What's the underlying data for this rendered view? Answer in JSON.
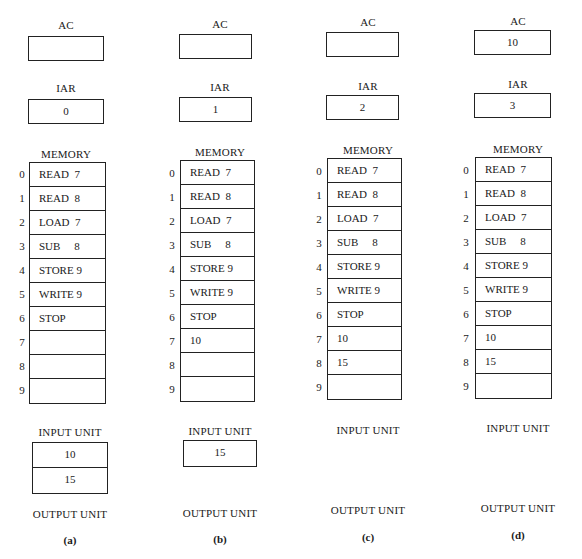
{
  "labels": {
    "ac": "AC",
    "iar": "IAR",
    "memory": "MEMORY",
    "input_unit": "INPUT UNIT",
    "output_unit": "OUTPUT UNIT"
  },
  "addresses": [
    "0",
    "1",
    "2",
    "3",
    "4",
    "5",
    "6",
    "7",
    "8",
    "9"
  ],
  "panels": [
    {
      "caption": "(a)",
      "ac": "",
      "iar": "0",
      "memory": [
        "READ  7",
        "READ  8",
        "LOAD  7",
        "SUB     8",
        "STORE 9",
        "WRITE 9",
        "STOP",
        "",
        "",
        ""
      ],
      "input_unit": [
        "10",
        "15"
      ]
    },
    {
      "caption": "(b)",
      "ac": "",
      "iar": "1",
      "memory": [
        "READ  7",
        "READ  8",
        "LOAD  7",
        "SUB     8",
        "STORE 9",
        "WRITE 9",
        "STOP",
        "10",
        "",
        ""
      ],
      "input_unit": [
        "15"
      ]
    },
    {
      "caption": "(c)",
      "ac": "",
      "iar": "2",
      "memory": [
        "READ  7",
        "READ  8",
        "LOAD  7",
        "SUB     8",
        "STORE 9",
        "WRITE 9",
        "STOP",
        "10",
        "15",
        ""
      ],
      "input_unit": []
    },
    {
      "caption": "(d)",
      "ac": "10",
      "iar": "3",
      "memory": [
        "READ  7",
        "READ  8",
        "LOAD  7",
        "SUB     8",
        "STORE 9",
        "WRITE 9",
        "STOP",
        "10",
        "15",
        ""
      ],
      "input_unit": []
    }
  ]
}
